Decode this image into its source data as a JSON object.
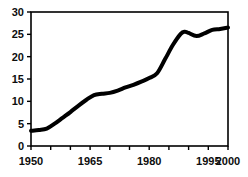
{
  "chart_data": {
    "type": "line",
    "title": "",
    "subtitle": "",
    "xlabel": "",
    "ylabel": "",
    "xlim": [
      1950,
      2000
    ],
    "ylim": [
      0,
      30
    ],
    "grid": false,
    "legend": null,
    "legend_position": "none",
    "x_tick_labels": [
      "1950",
      "1965",
      "1980",
      "1995",
      "2000"
    ],
    "x_tick_values": [
      1950,
      1965,
      1980,
      1995,
      2000
    ],
    "x_minor_tick_values": [
      1950,
      1955,
      1960,
      1965,
      1970,
      1975,
      1980,
      1985,
      1990,
      1995,
      2000
    ],
    "y_tick_labels": [
      "0",
      "5",
      "10",
      "15",
      "20",
      "25",
      "30"
    ],
    "y_tick_values": [
      0,
      5,
      10,
      15,
      20,
      25,
      30
    ],
    "series": [
      {
        "name": "series-1",
        "color": "#000000",
        "line_width": 4,
        "x": [
          1950,
          1952,
          1954,
          1956,
          1958,
          1960,
          1962,
          1964,
          1966,
          1968,
          1970,
          1972,
          1974,
          1976,
          1978,
          1980,
          1982,
          1984,
          1986,
          1988,
          1989,
          1990,
          1992,
          1994,
          1996,
          1998,
          2000
        ],
        "values": [
          3.4,
          3.6,
          3.9,
          5.0,
          6.3,
          7.6,
          9.0,
          10.3,
          11.4,
          11.7,
          11.9,
          12.4,
          13.1,
          13.7,
          14.4,
          15.2,
          16.3,
          19.4,
          22.6,
          25.1,
          25.6,
          25.3,
          24.6,
          25.2,
          26.0,
          26.2,
          26.5
        ]
      }
    ]
  },
  "axes": {
    "frame_color": "#000000",
    "tick_color": "#000000",
    "label_color": "#0d0d0d",
    "background": "#ffffff"
  }
}
